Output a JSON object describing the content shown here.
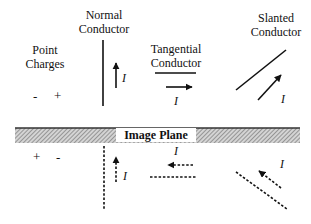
{
  "labels": {
    "point_charges": [
      "Point",
      "Charges"
    ],
    "normal_conductor": [
      "Normal",
      "Conductor"
    ],
    "tangential_conductor": [
      "Tangential",
      "Conductor"
    ],
    "slanted_conductor": [
      "Slanted",
      "Conductor"
    ],
    "image_plane": "Image Plane",
    "current_symbol": "I"
  },
  "charges": {
    "real": [
      "-",
      "+"
    ],
    "image": [
      "+",
      "-"
    ]
  },
  "colors": {
    "line": "#111111",
    "plane_hatch": "#888888",
    "background": "#ffffff"
  }
}
